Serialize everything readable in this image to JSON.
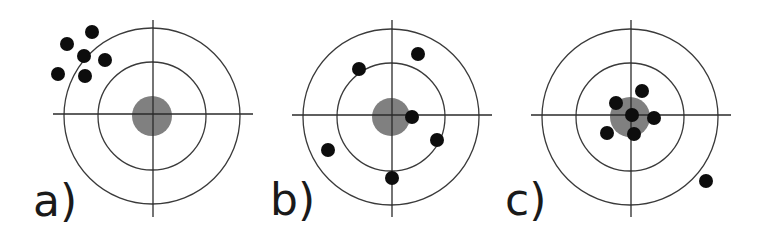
{
  "figure": {
    "colors": {
      "background": "#ffffff",
      "ring": "#3a3a3a",
      "crosshair": "#2a2a2a",
      "bullseye": "#808080",
      "shot": "#0d0d0d",
      "label": "#1a1a1a"
    },
    "panels": [
      {
        "id": "a",
        "label": "a)",
        "label_pos": {
          "x": 33,
          "y": 216
        },
        "center": {
          "x": 152,
          "y": 116
        },
        "rings": [
          88,
          54
        ],
        "bullseye_radius": 20,
        "crosshair": {
          "x1": 53,
          "x2": 253,
          "y_top": 20,
          "y_bottom": 217
        },
        "shot_radius": 7,
        "shots": [
          {
            "x": 92,
            "y": 32
          },
          {
            "x": 67,
            "y": 44
          },
          {
            "x": 84,
            "y": 56
          },
          {
            "x": 105,
            "y": 60
          },
          {
            "x": 58,
            "y": 74
          },
          {
            "x": 85,
            "y": 76
          }
        ]
      },
      {
        "id": "b",
        "label": "b)",
        "label_pos": {
          "x": 270,
          "y": 215
        },
        "center": {
          "x": 391,
          "y": 117
        },
        "rings": [
          88,
          54
        ],
        "bullseye_radius": 19,
        "crosshair": {
          "x1": 292,
          "x2": 492,
          "y_top": 20,
          "y_bottom": 217
        },
        "shot_radius": 7,
        "shots": [
          {
            "x": 418,
            "y": 54
          },
          {
            "x": 359,
            "y": 69
          },
          {
            "x": 412,
            "y": 117
          },
          {
            "x": 437,
            "y": 140
          },
          {
            "x": 328,
            "y": 150
          },
          {
            "x": 392,
            "y": 178
          }
        ]
      },
      {
        "id": "c",
        "label": "c)",
        "label_pos": {
          "x": 505,
          "y": 215
        },
        "center": {
          "x": 630,
          "y": 117
        },
        "rings": [
          88,
          54
        ],
        "bullseye_radius": 20,
        "crosshair": {
          "x1": 531,
          "x2": 731,
          "y_top": 20,
          "y_bottom": 217
        },
        "shot_radius": 7,
        "shots": [
          {
            "x": 642,
            "y": 91
          },
          {
            "x": 616,
            "y": 103
          },
          {
            "x": 632,
            "y": 115
          },
          {
            "x": 654,
            "y": 118
          },
          {
            "x": 607,
            "y": 133
          },
          {
            "x": 634,
            "y": 134
          },
          {
            "x": 706,
            "y": 181
          }
        ]
      }
    ]
  }
}
